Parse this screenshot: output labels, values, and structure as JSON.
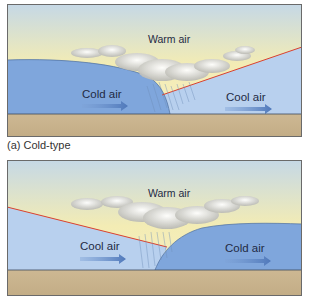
{
  "panels": [
    {
      "id": "a",
      "caption": "(a) Cold-type",
      "labels": {
        "warm": "Warm air",
        "left": "Cold air",
        "right": "Cool air"
      }
    },
    {
      "id": "b",
      "caption": "",
      "labels": {
        "warm": "Warm air",
        "left": "Cool air",
        "right": "Cold air"
      }
    }
  ],
  "colors": {
    "sky_top": "#c5d8e6",
    "sky_warm": "#f3ecb4",
    "cold_air": "#7fa6dc",
    "cool_air": "#b8d0ee",
    "ground": "#c9b58f",
    "front_line": "#d9402e",
    "arrow": "#5f86c4"
  }
}
